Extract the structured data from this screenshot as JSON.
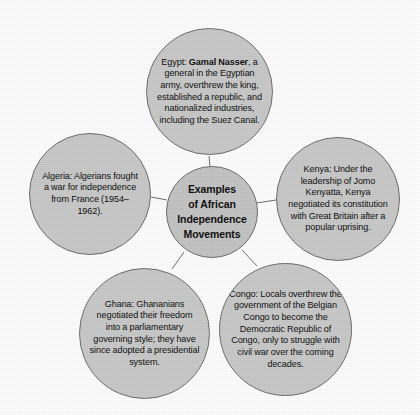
{
  "diagram": {
    "type": "bubble-cluster",
    "background_color": "#fdfdfd",
    "bubble_fill_color": "#c9c9c9",
    "bubble_border_color": "#6f6f6f",
    "text_color": "#111111",
    "center": {
      "id": "center",
      "label_line_1": "Examples",
      "label_line_2": "of African",
      "label_line_3": "Independence",
      "label_line_4": "Movements"
    },
    "nodes": [
      {
        "id": "egypt",
        "country": "Egypt",
        "prefix": "Egypt: ",
        "emphasis": "Gamal Nasser",
        "suffix": ", a general in the Egyptian army, overthrew the king, established a republic, and nationalized industries, including the Suez Canal.",
        "full_text": "Egypt: Gamal Nasser, a general in the Egyptian army, overthrew the king, established a republic, and nationalized industries, including the Suez Canal."
      },
      {
        "id": "algeria",
        "country": "Algeria",
        "full_text": "Algeria: Algerians fought a war for independence from France (1954–1962)."
      },
      {
        "id": "kenya",
        "country": "Kenya",
        "full_text": "Kenya: Under the leadership of Jomo Kenyatta, Kenya negotiated its constitution with Great Britain after a popular uprising."
      },
      {
        "id": "ghana",
        "country": "Ghana",
        "full_text": "Ghana: Ghananians negotiated their freedom into a parliamentary governing style; they have since adopted a presidential system."
      },
      {
        "id": "congo",
        "country": "Congo",
        "full_text": "Congo: Locals overthrew the government of the Belgian Congo to become the Democratic Republic of Congo, only to struggle with civil war over the coming decades."
      }
    ]
  }
}
